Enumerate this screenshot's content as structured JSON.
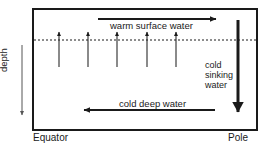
{
  "diagram": {
    "type": "cross-section-flow-diagram",
    "colors": {
      "stroke": "#1a1a1a",
      "background": "#ffffff",
      "dashed_line": "#1a1a1a"
    },
    "box": {
      "x": 33,
      "y": 9,
      "width": 224,
      "height": 121,
      "border_color": "#1a1a1a",
      "border_width": 2
    },
    "dashed_line": {
      "y": 40,
      "label": "thermocline-boundary",
      "dash_pattern": "2 2"
    },
    "labels": {
      "warm_surface_water": "warm surface water",
      "cold_deep_water": "cold deep water",
      "cold_sinking_water_line1": "cold",
      "cold_sinking_water_line2": "sinking",
      "cold_sinking_water_line3": "water",
      "depth_axis": "depth",
      "left_axis_bottom": "Equator",
      "right_axis_bottom": "Pole"
    },
    "arrows": {
      "warm_surface": {
        "name": "warm-surface-water-arrow",
        "direction": "right",
        "x1": 98,
        "y1": 19,
        "x2": 218,
        "y2": 19
      },
      "cold_deep": {
        "name": "cold-deep-water-arrow",
        "direction": "left",
        "x1": 215,
        "y1": 110,
        "x2": 82,
        "y2": 110
      },
      "cold_sinking": {
        "name": "cold-sinking-water-arrow",
        "direction": "down",
        "x1": 238,
        "y1": 20,
        "x2": 238,
        "y2": 119
      },
      "depth_axis": {
        "name": "depth-axis-arrow",
        "direction": "down",
        "x1": 22,
        "y1": 45,
        "x2": 22,
        "y2": 118
      },
      "upwelling": {
        "name": "upwelling-arrows",
        "direction": "up",
        "count": 5,
        "x_positions": [
          59,
          88,
          117,
          147,
          176
        ],
        "y_top": 31,
        "y_bottom": 67
      }
    }
  }
}
